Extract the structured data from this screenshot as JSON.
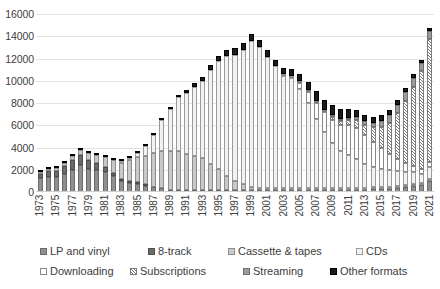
{
  "chart_data": {
    "type": "bar",
    "stacked": true,
    "title": "",
    "subtitle": "",
    "xlabel": "",
    "ylabel": "",
    "ylim": [
      0,
      16000
    ],
    "ytick_step": 2000,
    "ytick_labels": [
      "16000",
      "14000",
      "12000",
      "10000",
      "8000",
      "6000",
      "4000",
      "2000",
      "0"
    ],
    "grid": true,
    "legend_position": "bottom",
    "x_label_interval": 2,
    "categories": [
      "1973",
      "1974",
      "1975",
      "1976",
      "1977",
      "1978",
      "1979",
      "1980",
      "1981",
      "1982",
      "1983",
      "1984",
      "1985",
      "1986",
      "1987",
      "1988",
      "1989",
      "1990",
      "1991",
      "1992",
      "1993",
      "1994",
      "1995",
      "1996",
      "1997",
      "1998",
      "1999",
      "2000",
      "2001",
      "2002",
      "2003",
      "2004",
      "2005",
      "2006",
      "2007",
      "2008",
      "2009",
      "2010",
      "2011",
      "2012",
      "2013",
      "2014",
      "2015",
      "2016",
      "2017",
      "2018",
      "2019",
      "2020",
      "2021"
    ],
    "tick_labels": [
      "1973",
      "",
      "1975",
      "",
      "1977",
      "",
      "1979",
      "",
      "1981",
      "",
      "1983",
      "",
      "1985",
      "",
      "1987",
      "",
      "1989",
      "",
      "1991",
      "",
      "1993",
      "",
      "1995",
      "",
      "1997",
      "",
      "1999",
      "",
      "2001",
      "",
      "2003",
      "",
      "2005",
      "",
      "2007",
      "",
      "2009",
      "",
      "2011",
      "",
      "2013",
      "",
      "2015",
      "",
      "2017",
      "",
      "2019",
      "",
      "2021"
    ],
    "series": [
      {
        "name": "LP and vinyl",
        "key": "lp",
        "color": "#8f8f8f",
        "values": [
          1450,
          1500,
          1480,
          1750,
          2100,
          2500,
          2200,
          2050,
          1900,
          1550,
          1150,
          900,
          760,
          600,
          450,
          330,
          220,
          120,
          80,
          60,
          40,
          35,
          30,
          30,
          25,
          25,
          25,
          20,
          20,
          25,
          25,
          25,
          25,
          30,
          35,
          45,
          55,
          70,
          90,
          130,
          180,
          230,
          280,
          320,
          390,
          450,
          520,
          620,
          1000
        ]
      },
      {
        "name": "8-track",
        "key": "eight_track",
        "color": "#6b6b6b",
        "values": [
          430,
          530,
          580,
          720,
          900,
          950,
          800,
          620,
          420,
          250,
          120,
          60,
          20,
          5,
          0,
          0,
          0,
          0,
          0,
          0,
          0,
          0,
          0,
          0,
          0,
          0,
          0,
          0,
          0,
          0,
          0,
          0,
          0,
          0,
          0,
          0,
          0,
          0,
          0,
          0,
          0,
          0,
          0,
          0,
          0,
          0,
          0,
          0,
          0
        ]
      },
      {
        "name": "Cassette & tapes",
        "key": "cassette",
        "color": "#c9c9c9",
        "values": [
          120,
          180,
          230,
          300,
          400,
          480,
          600,
          780,
          950,
          1250,
          1600,
          2100,
          2450,
          2700,
          3100,
          3400,
          3450,
          3500,
          3300,
          3100,
          2900,
          2400,
          1900,
          1250,
          800,
          500,
          300,
          180,
          90,
          50,
          25,
          15,
          8,
          5,
          3,
          2,
          1,
          1,
          1,
          1,
          1,
          1,
          1,
          1,
          1,
          1,
          1,
          1,
          1
        ]
      },
      {
        "name": "CDs",
        "key": "cds",
        "color": "#f2f2f2",
        "values": [
          0,
          0,
          0,
          0,
          0,
          0,
          0,
          0,
          0,
          0,
          20,
          100,
          380,
          900,
          1700,
          2800,
          3800,
          4900,
          5500,
          6300,
          7000,
          8500,
          9800,
          10900,
          11500,
          12200,
          13200,
          12800,
          12000,
          11200,
          10500,
          10200,
          9300,
          8000,
          6500,
          5200,
          4300,
          3500,
          3100,
          2700,
          2200,
          1900,
          1700,
          1500,
          1400,
          1200,
          1100,
          800,
          1100
        ]
      },
      {
        "name": "Downloading",
        "key": "downloading",
        "color": "#ffffff",
        "values": [
          0,
          0,
          0,
          0,
          0,
          0,
          0,
          0,
          0,
          0,
          0,
          0,
          0,
          0,
          0,
          0,
          0,
          0,
          0,
          0,
          0,
          0,
          0,
          0,
          0,
          0,
          0,
          0,
          0,
          0,
          20,
          180,
          600,
          1000,
          1500,
          1900,
          2200,
          2500,
          2800,
          2900,
          2700,
          2300,
          1900,
          1500,
          1100,
          800,
          600,
          450,
          400
        ]
      },
      {
        "name": "Subscriptions",
        "key": "subscriptions",
        "color": "#7a7a7a",
        "values": [
          0,
          0,
          0,
          0,
          0,
          0,
          0,
          0,
          0,
          0,
          0,
          0,
          0,
          0,
          0,
          0,
          0,
          0,
          0,
          0,
          0,
          0,
          0,
          0,
          0,
          0,
          0,
          0,
          0,
          0,
          0,
          0,
          20,
          60,
          110,
          180,
          250,
          350,
          500,
          700,
          900,
          1350,
          1950,
          2900,
          4200,
          5700,
          7200,
          9000,
          11200
        ]
      },
      {
        "name": "Streaming",
        "key": "streaming",
        "color": "#9c9c9c",
        "values": [
          0,
          0,
          0,
          0,
          0,
          0,
          0,
          0,
          0,
          0,
          0,
          0,
          0,
          0,
          0,
          0,
          0,
          0,
          0,
          0,
          0,
          0,
          0,
          0,
          0,
          0,
          0,
          0,
          0,
          0,
          0,
          0,
          0,
          0,
          0,
          0,
          50,
          100,
          150,
          250,
          350,
          450,
          550,
          700,
          750,
          800,
          850,
          700,
          750
        ]
      },
      {
        "name": "Other formats",
        "key": "other",
        "color": "#1c1c1c",
        "values": [
          20,
          25,
          30,
          35,
          40,
          45,
          45,
          45,
          45,
          45,
          45,
          50,
          60,
          70,
          90,
          110,
          130,
          180,
          250,
          320,
          400,
          480,
          520,
          560,
          600,
          650,
          700,
          700,
          650,
          600,
          550,
          600,
          700,
          800,
          900,
          950,
          1000,
          900,
          800,
          700,
          600,
          550,
          500,
          450,
          400,
          380,
          350,
          300,
          280
        ]
      }
    ]
  },
  "legend": {
    "row1": [
      {
        "label": "LP and vinyl",
        "swatch": "s-lp"
      },
      {
        "label": "8-track",
        "swatch": "s-8t"
      },
      {
        "label": "Cassette & tapes",
        "swatch": "s-cass"
      },
      {
        "label": "CDs",
        "swatch": "s-cd"
      }
    ],
    "row2": [
      {
        "label": "Downloading",
        "swatch": "s-dl"
      },
      {
        "label": "Subscriptions",
        "swatch": "s-sub"
      },
      {
        "label": "Streaming",
        "swatch": "s-str"
      },
      {
        "label": "Other formats",
        "swatch": "s-other"
      }
    ]
  }
}
